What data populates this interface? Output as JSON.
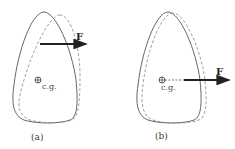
{
  "panels": [
    {
      "id": "a",
      "caption": "(a)",
      "force_label": "F",
      "cg_label": "c.g.",
      "description": "Force applied above the center of gravity; body rotates and translates (dashed outline shows displaced position)"
    },
    {
      "id": "b",
      "caption": "(b)",
      "force_label": "F",
      "cg_label": "c.g.",
      "description": "Force applied through the center of gravity; body translates without rotation (dashed outline shows displaced position)"
    }
  ],
  "colors": {
    "outline": "#555555",
    "dashed_outline": "#888888",
    "arrow": "#222222",
    "background": "#ffffff"
  }
}
